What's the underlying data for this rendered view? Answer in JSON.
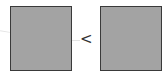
{
  "diagram": {
    "left_box": {
      "fill": "#a3a3a3",
      "border": "#3a3a3a"
    },
    "right_box": {
      "fill": "#a3a3a3",
      "border": "#3a3a3a"
    },
    "comparison_symbol": "<"
  }
}
